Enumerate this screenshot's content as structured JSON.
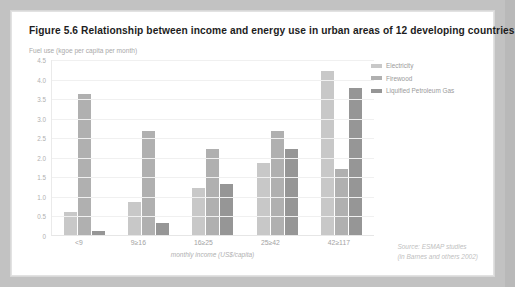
{
  "figure": {
    "title": "Figure 5.6 Relationship between income and energy use in urban areas of 12 developing countries",
    "source_line1": "Source: ESMAP studies",
    "source_line2": "(in Barnes and others 2002)"
  },
  "chart_data": {
    "type": "bar",
    "title": "Figure 5.6 Relationship between income and energy use in urban areas of 12 developing countries",
    "subtitle": "Fuel use (kgoe per capita per month)",
    "xlabel": "monthly income (US$/capita)",
    "ylabel": "Fuel use (kgoe per capita per month)",
    "categories": [
      "<9",
      "9≥16",
      "16≥25",
      "25≥42",
      "42≥117"
    ],
    "series": [
      {
        "name": "Electricity",
        "color": "#c8c8c8",
        "values": [
          0.6,
          0.85,
          1.2,
          1.85,
          4.2
        ]
      },
      {
        "name": "Firewood",
        "color": "#b0b0b0",
        "values": [
          3.6,
          2.65,
          2.2,
          2.65,
          1.7
        ]
      },
      {
        "name": "Liquified Petroleum Gas",
        "color": "#969696",
        "values": [
          0.1,
          0.3,
          1.3,
          2.2,
          3.75
        ]
      }
    ],
    "ylim": [
      0,
      4.5
    ],
    "ytick_labels": [
      "4.5",
      "4.0",
      "3.5",
      "3.0",
      "2.5",
      "2.0",
      "1.5",
      "1.0",
      "0.5",
      "0"
    ],
    "ytick_values": [
      4.5,
      4.0,
      3.5,
      3.0,
      2.5,
      2.0,
      1.5,
      1.0,
      0.5,
      0
    ],
    "grid": true,
    "legend_position": "right"
  }
}
